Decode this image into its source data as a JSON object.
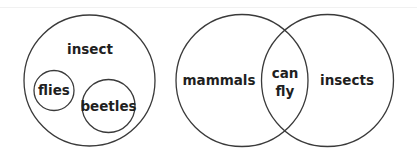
{
  "diagrams": [
    {
      "type": "nested-sets",
      "outer": {
        "label": "insect"
      },
      "inner": [
        {
          "label": "flies"
        },
        {
          "label": "beetles"
        }
      ]
    },
    {
      "type": "venn-two-set",
      "sets": [
        {
          "label": "mammals"
        },
        {
          "label": "insects"
        }
      ],
      "intersection": {
        "line1": "can",
        "line2": "fly"
      }
    }
  ]
}
